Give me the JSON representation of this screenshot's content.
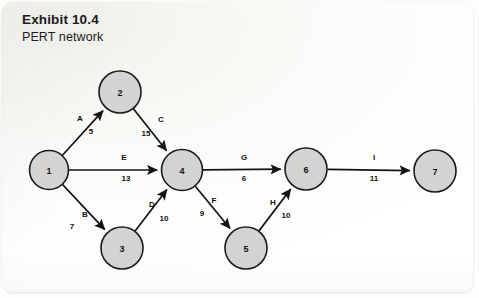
{
  "header": {
    "title": "Exhibit 10.4",
    "subtitle": "PERT network"
  },
  "colors": {
    "node_fill": "#d3d3d3",
    "node_stroke": "#1a1a1a",
    "edge": "#141414",
    "text": "#111111",
    "page_background": "#fdfdfb"
  },
  "chart_data": {
    "type": "diagram",
    "diagram_kind": "pert-network",
    "title": "Exhibit 10.4",
    "subtitle": "PERT network",
    "nodes": [
      {
        "id": "1",
        "label": "1",
        "cx": 49,
        "cy": 170,
        "r": 19.5
      },
      {
        "id": "2",
        "label": "2",
        "cx": 120,
        "cy": 92,
        "r": 21
      },
      {
        "id": "3",
        "label": "3",
        "cx": 122,
        "cy": 248,
        "r": 21
      },
      {
        "id": "4",
        "label": "4",
        "cx": 182,
        "cy": 170,
        "r": 20.5
      },
      {
        "id": "5",
        "label": "5",
        "cx": 246,
        "cy": 248,
        "r": 21
      },
      {
        "id": "6",
        "label": "6",
        "cx": 306,
        "cy": 169,
        "r": 21
      },
      {
        "id": "7",
        "label": "7",
        "cx": 435,
        "cy": 171,
        "r": 21
      }
    ],
    "edges": [
      {
        "id": "A",
        "activity": "A",
        "duration": 5,
        "from": "1",
        "to": "2",
        "activity_xy": [
          80,
          118
        ],
        "duration_xy": [
          91,
          131
        ]
      },
      {
        "id": "B",
        "activity": "B",
        "duration": 7,
        "from": "1",
        "to": "3",
        "activity_xy": [
          85,
          214
        ],
        "duration_xy": [
          72,
          226
        ]
      },
      {
        "id": "C",
        "activity": "C",
        "duration": 15,
        "from": "2",
        "to": "4",
        "activity_xy": [
          161,
          119
        ],
        "duration_xy": [
          146,
          133
        ]
      },
      {
        "id": "D",
        "activity": "D",
        "duration": 10,
        "from": "3",
        "to": "4",
        "activity_xy": [
          152,
          204
        ],
        "duration_xy": [
          164,
          218
        ]
      },
      {
        "id": "E",
        "activity": "E",
        "duration": 13,
        "from": "1",
        "to": "4",
        "activity_xy": [
          124,
          157
        ],
        "duration_xy": [
          126,
          178
        ]
      },
      {
        "id": "F",
        "activity": "F",
        "duration": 9,
        "from": "4",
        "to": "5",
        "activity_xy": [
          214,
          200
        ],
        "duration_xy": [
          202,
          213
        ]
      },
      {
        "id": "G",
        "activity": "G",
        "duration": 6,
        "from": "4",
        "to": "6",
        "activity_xy": [
          244,
          157
        ],
        "duration_xy": [
          244,
          178
        ]
      },
      {
        "id": "H",
        "activity": "H",
        "duration": 10,
        "from": "5",
        "to": "6",
        "activity_xy": [
          273,
          202
        ],
        "duration_xy": [
          286,
          215
        ]
      },
      {
        "id": "I",
        "activity": "I",
        "duration": 11,
        "from": "6",
        "to": "7",
        "activity_xy": [
          374,
          157
        ],
        "duration_xy": [
          374,
          178
        ]
      }
    ],
    "activity_labels": [
      "A",
      "B",
      "C",
      "D",
      "E",
      "F",
      "G",
      "H",
      "I"
    ],
    "durations": [
      5,
      7,
      15,
      10,
      13,
      9,
      6,
      10,
      11
    ],
    "node_labels": [
      "1",
      "2",
      "3",
      "4",
      "5",
      "6",
      "7"
    ]
  }
}
